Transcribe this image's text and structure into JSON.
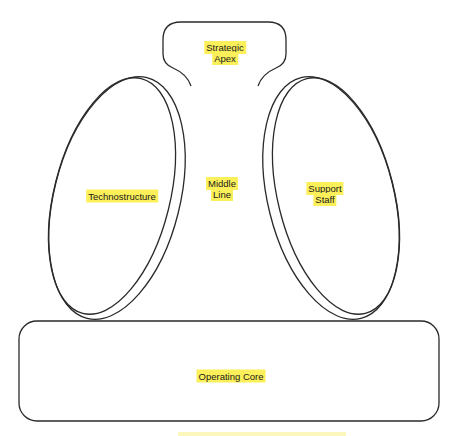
{
  "diagram": {
    "type": "organizational-structure",
    "stroke_color": "#2a2a2a",
    "highlight_color": "#fbef5a",
    "parts": [
      {
        "id": "strategic-apex",
        "lines": [
          "Strategic",
          "Apex"
        ]
      },
      {
        "id": "middle-line",
        "lines": [
          "Middle",
          "Line"
        ]
      },
      {
        "id": "technostructure",
        "lines": [
          "Technostructure"
        ]
      },
      {
        "id": "support-staff",
        "lines": [
          "Support",
          "Staff"
        ]
      },
      {
        "id": "operating-core",
        "lines": [
          "Operating Core"
        ]
      }
    ]
  }
}
